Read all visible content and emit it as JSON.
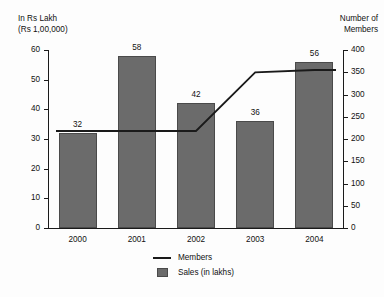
{
  "chart_data": {
    "type": "bar",
    "title": "",
    "categories": [
      "2000",
      "2001",
      "2002",
      "2003",
      "2004"
    ],
    "series": [
      {
        "name": "Sales (in lakhs)",
        "type": "bar",
        "axis": "left",
        "values": [
          32,
          58,
          42,
          36,
          56
        ],
        "color": "#6b6b6b"
      },
      {
        "name": "Members",
        "type": "line",
        "axis": "right",
        "values": [
          218,
          218,
          218,
          350,
          355
        ],
        "color": "#1a1a1a"
      }
    ],
    "left_axis": {
      "title": "In Rs Lakh\n(Rs 1,00,000)",
      "ticks": [
        0,
        10,
        20,
        30,
        40,
        50,
        60
      ],
      "ylim": [
        0,
        60
      ]
    },
    "right_axis": {
      "title": "Number of\nMembers",
      "ticks": [
        0,
        50,
        100,
        150,
        200,
        250,
        300,
        350,
        400
      ],
      "ylim": [
        0,
        400
      ]
    },
    "xlabel": "",
    "grid": false,
    "legend_position": "bottom-center",
    "data_labels": [
      "32",
      "58",
      "42",
      "36",
      "56"
    ]
  },
  "legend": {
    "items": [
      {
        "label": "Members",
        "key": "line-swatch"
      },
      {
        "label": "Sales (in lakhs)",
        "key": "box-swatch"
      }
    ]
  }
}
